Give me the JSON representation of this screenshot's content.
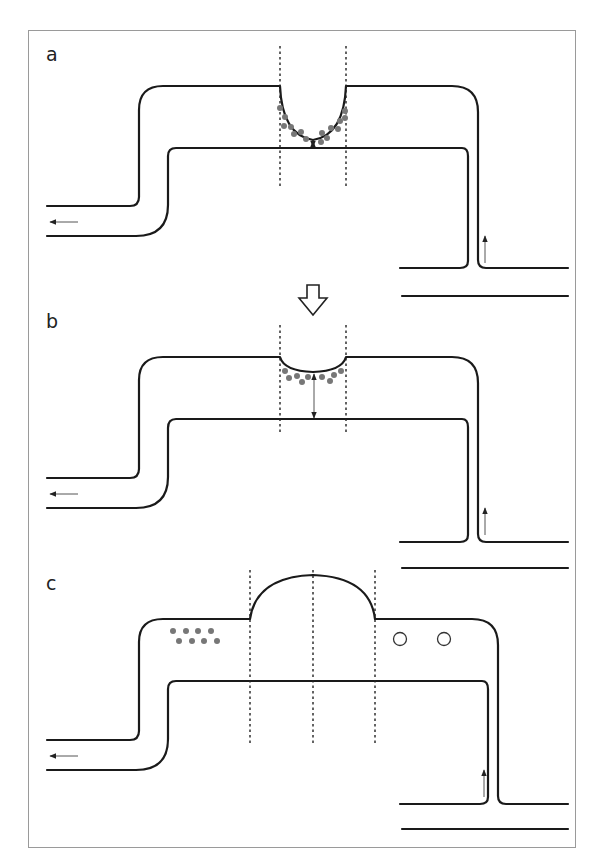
{
  "figure": {
    "panels": [
      {
        "label": "a",
        "description": "Meniscus deeply curved inward with particles clustered around it; short gap to lower wall (double arrow)"
      },
      {
        "label": "b",
        "description": "Meniscus shallow; particles along it; longer gap to lower wall (double arrow)"
      },
      {
        "label": "c",
        "description": "Meniscus bulged outward; filled dots to left, open circles to right"
      }
    ],
    "transition_arrow": "hollow-down-arrow",
    "flow_direction": {
      "inlet": "up-arrow bottom right",
      "outlet": "left-arrow bottom left"
    },
    "colors": {
      "wall": "#1a1a1a",
      "particles": "#777777",
      "frame": "#9a9a9a"
    }
  }
}
